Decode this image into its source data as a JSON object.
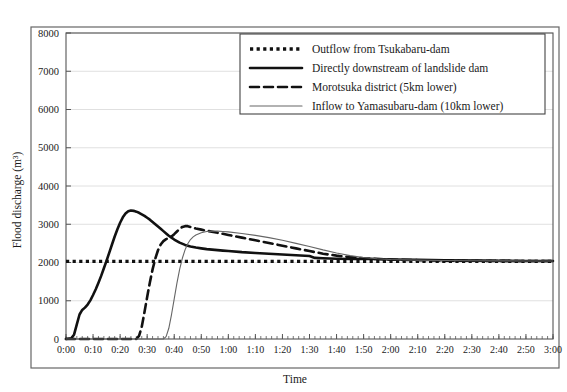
{
  "figure": {
    "name": "flood-discharge-hydrograph",
    "background_color": "#ffffff",
    "frame_color": "#555555",
    "artifact_note": "scanned page artifacts above chart"
  },
  "chart_data": {
    "type": "line",
    "title": "",
    "xlabel": "Time",
    "ylabel": "Flood discharge (m³)",
    "ylabel_plain": "Flood discharge (m3)",
    "grid": true,
    "legend_position": "top-center",
    "ylim": [
      0,
      8000
    ],
    "yticks": [
      0,
      1000,
      2000,
      3000,
      4000,
      5000,
      6000,
      7000,
      8000
    ],
    "ytick_labels": [
      "0",
      "1000",
      "2000",
      "3000",
      "4000",
      "5000",
      "6000",
      "7000",
      "8000"
    ],
    "xlim": [
      0,
      180
    ],
    "xticks": [
      0,
      10,
      20,
      30,
      40,
      50,
      60,
      70,
      80,
      90,
      100,
      110,
      120,
      130,
      140,
      150,
      160,
      170,
      180
    ],
    "xtick_labels": [
      "0:00",
      "0:10",
      "0:20",
      "0:30",
      "0:40",
      "0:50",
      "1:00",
      "1:10",
      "1:20",
      "1:30",
      "1:40",
      "1:50",
      "2:00",
      "2:10",
      "2:20",
      "2:30",
      "2:40",
      "2:50",
      "3:00"
    ],
    "x_minor_tick_interval_minutes": 2,
    "series": [
      {
        "name": "Outflow from Tsukabaru-dam",
        "style": "dotted",
        "color": "#111111",
        "width": 3.4,
        "dash": "3.2,3.4",
        "points": [
          [
            0,
            2030
          ],
          [
            180,
            2030
          ]
        ]
      },
      {
        "name": "Directly downstream of landslide dam",
        "style": "solid-thick",
        "color": "#111111",
        "width": 2.6,
        "dash": "",
        "points": [
          [
            0,
            0
          ],
          [
            2,
            20
          ],
          [
            3,
            120
          ],
          [
            4,
            380
          ],
          [
            5,
            640
          ],
          [
            6,
            760
          ],
          [
            7,
            820
          ],
          [
            8,
            900
          ],
          [
            9,
            1010
          ],
          [
            10,
            1150
          ],
          [
            11,
            1300
          ],
          [
            12,
            1470
          ],
          [
            13,
            1650
          ],
          [
            14,
            1850
          ],
          [
            15,
            2050
          ],
          [
            16,
            2260
          ],
          [
            17,
            2470
          ],
          [
            18,
            2680
          ],
          [
            19,
            2870
          ],
          [
            20,
            3040
          ],
          [
            21,
            3180
          ],
          [
            22,
            3280
          ],
          [
            23,
            3340
          ],
          [
            24,
            3360
          ],
          [
            25,
            3350
          ],
          [
            26,
            3330
          ],
          [
            27,
            3300
          ],
          [
            28,
            3260
          ],
          [
            29,
            3220
          ],
          [
            30,
            3170
          ],
          [
            31,
            3120
          ],
          [
            32,
            3060
          ],
          [
            33,
            3000
          ],
          [
            34,
            2940
          ],
          [
            35,
            2880
          ],
          [
            36,
            2820
          ],
          [
            37,
            2760
          ],
          [
            38,
            2700
          ],
          [
            39,
            2650
          ],
          [
            40,
            2600
          ],
          [
            42,
            2520
          ],
          [
            44,
            2460
          ],
          [
            46,
            2420
          ],
          [
            48,
            2390
          ],
          [
            50,
            2370
          ],
          [
            52,
            2350
          ],
          [
            55,
            2330
          ],
          [
            58,
            2310
          ],
          [
            60,
            2300
          ],
          [
            65,
            2270
          ],
          [
            70,
            2250
          ],
          [
            75,
            2230
          ],
          [
            80,
            2210
          ],
          [
            85,
            2190
          ],
          [
            90,
            2170
          ],
          [
            92,
            2120
          ],
          [
            95,
            2110
          ],
          [
            100,
            2100
          ],
          [
            105,
            2090
          ],
          [
            110,
            2100
          ],
          [
            115,
            2090
          ],
          [
            120,
            2080
          ],
          [
            130,
            2070
          ],
          [
            140,
            2060
          ],
          [
            150,
            2050
          ],
          [
            160,
            2045
          ],
          [
            170,
            2040
          ],
          [
            180,
            2040
          ]
        ]
      },
      {
        "name": "Morotsuka district (5km lower)",
        "style": "dashed",
        "color": "#111111",
        "width": 2.6,
        "dash": "9,5",
        "points": [
          [
            0,
            0
          ],
          [
            26,
            0
          ],
          [
            27,
            80
          ],
          [
            28,
            320
          ],
          [
            29,
            700
          ],
          [
            30,
            1100
          ],
          [
            31,
            1480
          ],
          [
            32,
            1820
          ],
          [
            33,
            2100
          ],
          [
            34,
            2320
          ],
          [
            35,
            2470
          ],
          [
            36,
            2560
          ],
          [
            37,
            2610
          ],
          [
            38,
            2640
          ],
          [
            39,
            2680
          ],
          [
            40,
            2740
          ],
          [
            41,
            2810
          ],
          [
            42,
            2880
          ],
          [
            43,
            2930
          ],
          [
            44,
            2950
          ],
          [
            45,
            2950
          ],
          [
            46,
            2930
          ],
          [
            47,
            2910
          ],
          [
            48,
            2890
          ],
          [
            50,
            2860
          ],
          [
            52,
            2830
          ],
          [
            55,
            2790
          ],
          [
            58,
            2750
          ],
          [
            60,
            2720
          ],
          [
            65,
            2650
          ],
          [
            70,
            2580
          ],
          [
            75,
            2510
          ],
          [
            80,
            2440
          ],
          [
            85,
            2370
          ],
          [
            90,
            2300
          ],
          [
            95,
            2230
          ],
          [
            100,
            2180
          ],
          [
            105,
            2140
          ],
          [
            110,
            2110
          ],
          [
            115,
            2090
          ],
          [
            120,
            2075
          ],
          [
            130,
            2060
          ],
          [
            140,
            2050
          ],
          [
            150,
            2045
          ],
          [
            160,
            2042
          ],
          [
            170,
            2040
          ],
          [
            180,
            2040
          ]
        ]
      },
      {
        "name": "Inflow to Yamasubaru-dam (10km lower)",
        "style": "solid-thin",
        "color": "#666666",
        "width": 1.1,
        "dash": "",
        "points": [
          [
            0,
            0
          ],
          [
            36,
            0
          ],
          [
            37,
            60
          ],
          [
            38,
            280
          ],
          [
            39,
            640
          ],
          [
            40,
            1050
          ],
          [
            41,
            1460
          ],
          [
            42,
            1820
          ],
          [
            43,
            2110
          ],
          [
            44,
            2330
          ],
          [
            45,
            2490
          ],
          [
            46,
            2600
          ],
          [
            47,
            2670
          ],
          [
            48,
            2720
          ],
          [
            50,
            2780
          ],
          [
            52,
            2810
          ],
          [
            54,
            2820
          ],
          [
            56,
            2820
          ],
          [
            58,
            2810
          ],
          [
            60,
            2800
          ],
          [
            65,
            2760
          ],
          [
            70,
            2710
          ],
          [
            75,
            2650
          ],
          [
            80,
            2580
          ],
          [
            85,
            2500
          ],
          [
            90,
            2420
          ],
          [
            95,
            2330
          ],
          [
            100,
            2250
          ],
          [
            105,
            2180
          ],
          [
            110,
            2130
          ],
          [
            115,
            2100
          ],
          [
            120,
            2080
          ],
          [
            130,
            2062
          ],
          [
            140,
            2052
          ],
          [
            150,
            2046
          ],
          [
            160,
            2043
          ],
          [
            170,
            2041
          ],
          [
            180,
            2040
          ]
        ]
      }
    ],
    "annotations": {
      "peak_downstream_landslide_dam": 3350,
      "peak_morotsuka": 2950,
      "peak_yamasubaru_inflow": 2820,
      "baseline_outflow": 2030
    }
  },
  "legend": {
    "items": [
      {
        "label": "Outflow from Tsukabaru-dam",
        "style": "dotted"
      },
      {
        "label": "Directly downstream of landslide dam",
        "style": "solid-thick"
      },
      {
        "label": "Morotsuka district (5km lower)",
        "style": "dashed"
      },
      {
        "label": "Inflow to Yamasubaru-dam (10km lower)",
        "style": "solid-thin"
      }
    ]
  }
}
